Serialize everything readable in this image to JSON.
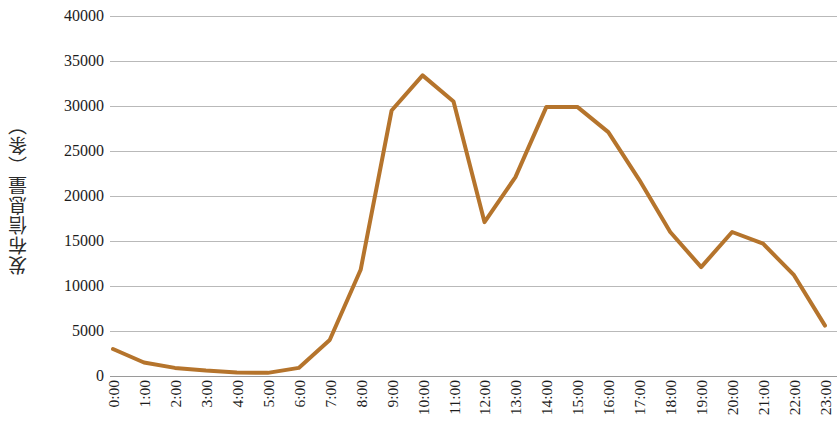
{
  "chart_data": {
    "type": "line",
    "title": "",
    "subtitle": "",
    "xlabel": "",
    "ylabel": "发布信息量（条）",
    "categories": [
      "0:00",
      "1:00",
      "2:00",
      "3:00",
      "4:00",
      "5:00",
      "6:00",
      "7:00",
      "8:00",
      "9:00",
      "10:00",
      "11:00",
      "12:00",
      "13:00",
      "14:00",
      "15:00",
      "16:00",
      "17:00",
      "18:00",
      "19:00",
      "20:00",
      "21:00",
      "22:00",
      "23:00"
    ],
    "values": [
      3000,
      1500,
      900,
      600,
      400,
      350,
      900,
      4000,
      11800,
      29500,
      33400,
      30500,
      17100,
      22100,
      29900,
      29900,
      27100,
      21800,
      16000,
      12100,
      16000,
      14700,
      11200,
      5600
    ],
    "series": [
      {
        "name": "发布信息量",
        "color": "#b5742c",
        "values": [
          3000,
          1500,
          900,
          600,
          400,
          350,
          900,
          4000,
          11800,
          29500,
          33400,
          30500,
          17100,
          22100,
          29900,
          29900,
          27100,
          21800,
          16000,
          12100,
          16000,
          14700,
          11200,
          5600
        ]
      }
    ],
    "ylim": [
      0,
      40000
    ],
    "y_ticks": [
      0,
      5000,
      10000,
      15000,
      20000,
      25000,
      30000,
      35000,
      40000
    ],
    "y_tick_labels": [
      "0",
      "5000",
      "10000",
      "15000",
      "20000",
      "25000",
      "30000",
      "35000",
      "40000"
    ],
    "grid": true,
    "grid_axis": "y",
    "legend": false,
    "legend_position": "none",
    "line_width": 4,
    "markers": false,
    "colors": {
      "line": "#b5742c",
      "gridline": "#b9b9b9",
      "axis": "#9a9a9a",
      "text": "#1c1c1c",
      "background": "#ffffff"
    }
  }
}
